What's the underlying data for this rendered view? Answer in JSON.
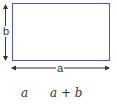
{
  "diagram": {
    "shape": "rectangle",
    "stroke_color": "#4a5aa8",
    "side_labels": {
      "height": "b",
      "width": "a"
    },
    "expressions": [
      "a",
      "a + b"
    ]
  }
}
